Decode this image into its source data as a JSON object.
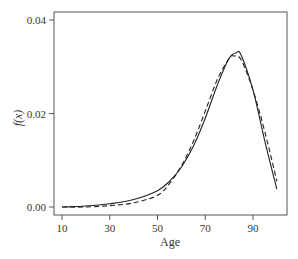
{
  "chart_data": {
    "type": "line",
    "title": "",
    "xlabel": "Age",
    "ylabel": "f(x)",
    "xlim": [
      8,
      105
    ],
    "ylim": [
      -0.0017,
      0.0415
    ],
    "xticks": [
      10,
      30,
      50,
      70,
      90
    ],
    "yticks": [
      "0.00",
      "0.02",
      "0.04"
    ],
    "grid": false,
    "legend": null,
    "series": [
      {
        "name": "solid",
        "style": "solid",
        "x": [
          10,
          20,
          30,
          40,
          50,
          55,
          60,
          65,
          70,
          75,
          80,
          83,
          85,
          90,
          95,
          100
        ],
        "y": [
          0.0,
          0.0002,
          0.0007,
          0.0016,
          0.0035,
          0.0055,
          0.0085,
          0.013,
          0.019,
          0.026,
          0.0318,
          0.033,
          0.0325,
          0.025,
          0.014,
          0.0038
        ]
      },
      {
        "name": "dashed",
        "style": "dashed",
        "x": [
          10,
          20,
          30,
          40,
          50,
          55,
          60,
          65,
          70,
          75,
          80,
          82,
          85,
          90,
          95,
          100
        ],
        "y": [
          0.0,
          0.0,
          0.0003,
          0.0009,
          0.0025,
          0.005,
          0.0088,
          0.014,
          0.0205,
          0.0272,
          0.0318,
          0.0323,
          0.0315,
          0.025,
          0.016,
          0.0055
        ]
      }
    ]
  }
}
